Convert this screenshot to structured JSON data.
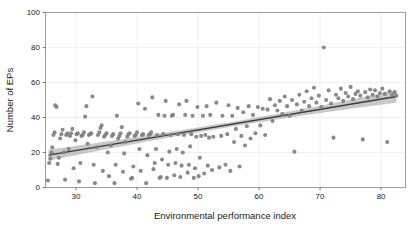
{
  "chart_data": {
    "type": "scatter",
    "title": "",
    "xlabel": "Environmental performance index",
    "ylabel": "Number of EPs",
    "xlim": [
      25,
      84
    ],
    "ylim": [
      0,
      100
    ],
    "xticks": [
      30,
      40,
      50,
      60,
      70,
      80
    ],
    "yticks": [
      0,
      20,
      40,
      60,
      80,
      100
    ],
    "grid": true,
    "legend": "none",
    "point_color": "#808080",
    "point_size": 3.2,
    "line_color": "#3a3a3a",
    "band_color": "#9a9a9a",
    "fit": {
      "type": "linear",
      "x_start": 25.5,
      "x_end": 82.5,
      "y_start": 18.5,
      "y_end": 52.0,
      "ci_half_width_start": 3.2,
      "ci_half_width_mid": 1.4,
      "ci_half_width_end": 3.6
    },
    "points": [
      [
        25.4,
        4.0
      ],
      [
        25.6,
        14.0
      ],
      [
        25.8,
        16.5
      ],
      [
        26.0,
        20.0
      ],
      [
        26.1,
        23.0
      ],
      [
        26.3,
        30.0
      ],
      [
        26.5,
        31.5
      ],
      [
        26.6,
        47.0
      ],
      [
        26.8,
        46.0
      ],
      [
        27.0,
        13.5
      ],
      [
        27.2,
        17.0
      ],
      [
        27.4,
        28.0
      ],
      [
        27.6,
        30.5
      ],
      [
        27.8,
        33.0
      ],
      [
        28.0,
        20.0
      ],
      [
        28.2,
        4.5
      ],
      [
        28.4,
        30.0
      ],
      [
        28.6,
        31.0
      ],
      [
        28.8,
        22.0
      ],
      [
        29.0,
        29.5
      ],
      [
        29.2,
        31.0
      ],
      [
        29.4,
        33.5
      ],
      [
        29.6,
        11.0
      ],
      [
        29.9,
        27.0
      ],
      [
        30.1,
        30.5
      ],
      [
        30.3,
        31.0
      ],
      [
        30.5,
        3.5
      ],
      [
        30.7,
        14.0
      ],
      [
        30.9,
        29.5
      ],
      [
        31.1,
        30.0
      ],
      [
        31.3,
        31.5
      ],
      [
        31.5,
        40.5
      ],
      [
        31.7,
        46.5
      ],
      [
        31.9,
        25.0
      ],
      [
        32.1,
        30.0
      ],
      [
        32.3,
        30.5
      ],
      [
        32.5,
        31.0
      ],
      [
        32.7,
        52.0
      ],
      [
        32.9,
        13.0
      ],
      [
        33.1,
        2.5
      ],
      [
        33.4,
        23.0
      ],
      [
        33.6,
        30.0
      ],
      [
        33.8,
        31.5
      ],
      [
        34.0,
        34.0
      ],
      [
        34.2,
        35.5
      ],
      [
        34.4,
        9.5
      ],
      [
        34.6,
        29.0
      ],
      [
        34.8,
        30.0
      ],
      [
        35.0,
        31.0
      ],
      [
        35.2,
        20.0
      ],
      [
        35.4,
        6.5
      ],
      [
        35.7,
        24.0
      ],
      [
        35.9,
        29.5
      ],
      [
        36.1,
        30.5
      ],
      [
        36.3,
        2.5
      ],
      [
        36.5,
        13.0
      ],
      [
        36.7,
        41.0
      ],
      [
        36.9,
        28.0
      ],
      [
        37.1,
        29.5
      ],
      [
        37.3,
        31.0
      ],
      [
        37.5,
        34.5
      ],
      [
        37.7,
        9.0
      ],
      [
        37.9,
        19.5
      ],
      [
        38.1,
        26.0
      ],
      [
        38.4,
        29.0
      ],
      [
        38.6,
        30.5
      ],
      [
        38.8,
        31.0
      ],
      [
        39.0,
        5.0
      ],
      [
        39.2,
        5.5
      ],
      [
        39.4,
        12.0
      ],
      [
        39.6,
        29.5
      ],
      [
        39.8,
        30.0
      ],
      [
        40.0,
        31.5
      ],
      [
        40.2,
        48.0
      ],
      [
        40.4,
        22.0
      ],
      [
        40.6,
        9.5
      ],
      [
        40.8,
        30.0
      ],
      [
        41.0,
        30.5
      ],
      [
        41.3,
        45.0
      ],
      [
        41.5,
        2.5
      ],
      [
        41.7,
        18.5
      ],
      [
        41.9,
        30.0
      ],
      [
        42.1,
        30.5
      ],
      [
        42.3,
        31.5
      ],
      [
        42.5,
        51.5
      ],
      [
        42.7,
        10.5
      ],
      [
        42.9,
        14.0
      ],
      [
        43.1,
        22.0
      ],
      [
        43.3,
        30.0
      ],
      [
        43.5,
        41.5
      ],
      [
        43.7,
        5.5
      ],
      [
        43.9,
        6.0
      ],
      [
        44.1,
        16.0
      ],
      [
        44.3,
        30.5
      ],
      [
        44.5,
        41.0
      ],
      [
        44.7,
        49.5
      ],
      [
        44.9,
        5.5
      ],
      [
        45.1,
        13.0
      ],
      [
        45.3,
        20.5
      ],
      [
        45.5,
        30.0
      ],
      [
        45.7,
        41.0
      ],
      [
        45.9,
        41.5
      ],
      [
        46.1,
        7.0
      ],
      [
        46.3,
        14.0
      ],
      [
        46.5,
        22.0
      ],
      [
        46.7,
        30.5
      ],
      [
        46.9,
        47.5
      ],
      [
        47.1,
        6.0
      ],
      [
        47.3,
        12.5
      ],
      [
        47.5,
        20.0
      ],
      [
        47.7,
        30.0
      ],
      [
        47.9,
        41.5
      ],
      [
        48.1,
        49.5
      ],
      [
        48.3,
        8.5
      ],
      [
        48.5,
        13.0
      ],
      [
        48.7,
        23.5
      ],
      [
        48.9,
        30.5
      ],
      [
        49.1,
        41.0
      ],
      [
        49.3,
        5.5
      ],
      [
        49.5,
        11.0
      ],
      [
        49.7,
        29.0
      ],
      [
        49.9,
        46.0
      ],
      [
        50.1,
        6.5
      ],
      [
        50.3,
        17.0
      ],
      [
        50.5,
        29.5
      ],
      [
        50.8,
        41.0
      ],
      [
        51.0,
        8.0
      ],
      [
        51.2,
        30.0
      ],
      [
        51.4,
        46.5
      ],
      [
        51.6,
        12.5
      ],
      [
        51.8,
        28.5
      ],
      [
        52.0,
        41.5
      ],
      [
        52.3,
        10.0
      ],
      [
        52.5,
        29.0
      ],
      [
        53.0,
        48.5
      ],
      [
        53.5,
        11.5
      ],
      [
        53.8,
        29.5
      ],
      [
        54.0,
        41.0
      ],
      [
        54.5,
        13.0
      ],
      [
        54.8,
        30.5
      ],
      [
        55.0,
        47.0
      ],
      [
        55.3,
        9.5
      ],
      [
        55.6,
        41.0
      ],
      [
        55.9,
        26.0
      ],
      [
        56.2,
        33.5
      ],
      [
        56.5,
        45.5
      ],
      [
        56.8,
        12.0
      ],
      [
        57.1,
        29.5
      ],
      [
        57.4,
        43.0
      ],
      [
        57.7,
        24.0
      ],
      [
        58.0,
        35.0
      ],
      [
        58.3,
        46.5
      ],
      [
        58.6,
        28.0
      ],
      [
        59.0,
        41.5
      ],
      [
        59.4,
        31.0
      ],
      [
        59.8,
        46.0
      ],
      [
        60.2,
        35.5
      ],
      [
        60.6,
        45.0
      ],
      [
        61.0,
        30.0
      ],
      [
        61.4,
        44.5
      ],
      [
        61.8,
        50.5
      ],
      [
        62.2,
        38.0
      ],
      [
        62.6,
        47.0
      ],
      [
        63.0,
        44.0
      ],
      [
        63.4,
        49.5
      ],
      [
        63.8,
        42.0
      ],
      [
        64.2,
        52.0
      ],
      [
        64.6,
        46.5
      ],
      [
        65.0,
        41.0
      ],
      [
        65.4,
        50.0
      ],
      [
        65.8,
        20.5
      ],
      [
        66.2,
        47.5
      ],
      [
        66.6,
        53.0
      ],
      [
        67.0,
        44.0
      ],
      [
        67.4,
        49.0
      ],
      [
        67.8,
        55.0
      ],
      [
        68.2,
        46.5
      ],
      [
        68.6,
        51.0
      ],
      [
        69.0,
        57.0
      ],
      [
        69.4,
        48.5
      ],
      [
        69.8,
        52.5
      ],
      [
        70.2,
        46.0
      ],
      [
        70.6,
        80.0
      ],
      [
        71.0,
        50.0
      ],
      [
        71.4,
        55.5
      ],
      [
        71.8,
        48.0
      ],
      [
        72.2,
        28.5
      ],
      [
        72.6,
        53.0
      ],
      [
        73.0,
        51.0
      ],
      [
        73.4,
        56.5
      ],
      [
        73.8,
        49.5
      ],
      [
        74.2,
        54.0
      ],
      [
        74.6,
        52.0
      ],
      [
        75.0,
        57.5
      ],
      [
        75.4,
        50.5
      ],
      [
        75.8,
        53.5
      ],
      [
        76.2,
        55.0
      ],
      [
        76.6,
        52.5
      ],
      [
        77.0,
        27.5
      ],
      [
        77.4,
        54.5
      ],
      [
        77.8,
        51.5
      ],
      [
        78.2,
        56.0
      ],
      [
        78.6,
        53.0
      ],
      [
        79.0,
        55.5
      ],
      [
        79.4,
        52.0
      ],
      [
        79.8,
        54.0
      ],
      [
        80.2,
        56.5
      ],
      [
        80.6,
        53.5
      ],
      [
        81.0,
        26.0
      ],
      [
        81.4,
        55.0
      ],
      [
        81.8,
        53.0
      ],
      [
        82.2,
        54.5
      ],
      [
        82.5,
        52.5
      ]
    ]
  }
}
